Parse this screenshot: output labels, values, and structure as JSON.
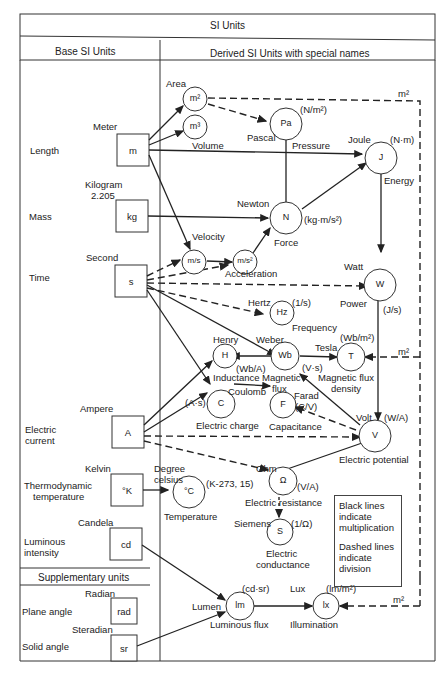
{
  "title": "SI Units",
  "headers": {
    "base": "Base   SI   Units",
    "derived": "Derived   SI   Units with special names",
    "supplementary": "Supplementary units"
  },
  "base_units": [
    {
      "quantity": "Length",
      "name": "Meter",
      "symbol": "m"
    },
    {
      "quantity": "Mass",
      "name": "Kilogram\n2.205",
      "name_line1": "Kilogram",
      "name_line2": "2.205",
      "symbol": "kg"
    },
    {
      "quantity": "Time",
      "name": "Second",
      "symbol": "s"
    },
    {
      "quantity_line1": "Electric",
      "quantity_line2": "current",
      "name": "Ampere",
      "symbol": "A"
    },
    {
      "quantity_line1": "Thermodynamic",
      "quantity_line2": "temperature",
      "name": "Kelvin",
      "symbol": "°K"
    },
    {
      "quantity_line1": "Luminous",
      "quantity_line2": "intensity",
      "name": "Candela",
      "symbol": "cd"
    }
  ],
  "supplementary_units": [
    {
      "quantity": "Plane angle",
      "name": "Radian",
      "symbol": "rad"
    },
    {
      "quantity": "Solid angle",
      "name": "Steradian",
      "symbol": "sr"
    }
  ],
  "derived_units": {
    "area": {
      "symbol": "m²",
      "label": "Area"
    },
    "volume": {
      "symbol": "m³",
      "label": "Volume"
    },
    "pascal": {
      "symbol": "Pa",
      "name": "Pascal",
      "quantity": "Pressure",
      "formula": "(N/m²)"
    },
    "joule": {
      "symbol": "J",
      "name": "Joule",
      "quantity": "Energy",
      "formula": "(N·m)"
    },
    "newton": {
      "symbol": "N",
      "name": "Newton",
      "quantity": "Force",
      "formula": "(kg·m/s²)"
    },
    "velocity": {
      "symbol": "m/s",
      "label": "Velocity"
    },
    "acceleration": {
      "symbol": "m/s²",
      "label": "Acceleration"
    },
    "watt": {
      "symbol": "W",
      "name": "Watt",
      "quantity": "Power",
      "formula": "(J/s)"
    },
    "hertz": {
      "symbol": "Hz",
      "name": "Hertz",
      "quantity": "Frequency",
      "formula": "(1/s)"
    },
    "henry": {
      "symbol": "H",
      "name": "Henry",
      "quantity": "Inductance",
      "formula": "(Wb/A)"
    },
    "weber": {
      "symbol": "Wb",
      "name": "Weber",
      "quantity_line1": "Magnetic",
      "quantity_line2": "flux",
      "formula": "(V·s)"
    },
    "tesla": {
      "symbol": "T",
      "name": "Tesla",
      "quantity_line1": "Magnetic flux",
      "quantity_line2": "density",
      "formula": "(Wb/m²)"
    },
    "coulomb": {
      "symbol": "C",
      "name": "Coulomb",
      "quantity": "Electric charge",
      "formula": "(A·s)"
    },
    "farad": {
      "symbol": "F",
      "name": "Farad",
      "quantity": "Capacitance",
      "formula": "(C/V)"
    },
    "volt": {
      "symbol": "V",
      "name": "Volt",
      "quantity": "Electric potential",
      "formula": "(W/A)"
    },
    "ohm": {
      "symbol": "Ω",
      "name": "Ohm",
      "quantity": "Electric resistance",
      "formula": "(V/A)"
    },
    "siemens": {
      "symbol": "S",
      "name": "Siemens",
      "quantity_line1": "Electric",
      "quantity_line2": "conductance",
      "formula": "(1/Ω)"
    },
    "celsius": {
      "symbol": "°C",
      "name_line1": "Degree",
      "name_line2": "celsius",
      "quantity": "Temperature",
      "formula": "(K-273, 15)"
    },
    "lumen": {
      "symbol": "lm",
      "name": "Lumen",
      "quantity": "Luminous flux",
      "formula": "(cd·sr)"
    },
    "lux": {
      "symbol": "lx",
      "name": "Lux",
      "quantity": "Illumination",
      "formula": "(lm/m²)"
    }
  },
  "dashed_labels": {
    "m2_top": "m²",
    "m2_tesla": "m²",
    "m2_lux": "m²"
  },
  "legend": {
    "black": "Black lines indicate multiplication",
    "black_l1": "Black lines",
    "black_l2": "indicate",
    "black_l3": "multiplication",
    "dashed_l1": "Dashed lines",
    "dashed_l2": "indicate",
    "dashed_l3": "division"
  }
}
